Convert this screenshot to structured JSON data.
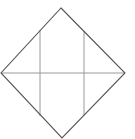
{
  "diagram": {
    "shape": "diamond-with-grid",
    "colors": {
      "background": "#ffffff",
      "outline": "#555555",
      "inner_lines": "#9a9a9a"
    },
    "outline_points": [
      [
        61,
        8
      ],
      [
        125,
        73
      ],
      [
        62,
        138
      ],
      [
        1,
        73
      ]
    ],
    "inner_lines": [
      {
        "name": "horizontal-midline",
        "x1": 1,
        "y1": 73,
        "x2": 125,
        "y2": 73
      },
      {
        "name": "left-vertical",
        "x1": 40,
        "y1": 30,
        "x2": 40,
        "y2": 116
      },
      {
        "name": "right-vertical",
        "x1": 84,
        "y1": 31,
        "x2": 84,
        "y2": 115
      }
    ]
  }
}
